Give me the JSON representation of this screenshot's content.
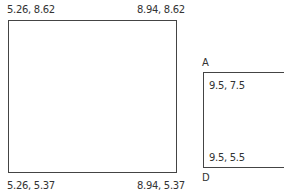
{
  "diagram": {
    "rect_left": {
      "top_left": "5.26, 8.62",
      "top_right": "8.94, 8.62",
      "bottom_left": "5.26, 5.37",
      "bottom_right": "8.94, 5.37"
    },
    "rect_right": {
      "corner_top_label": "A",
      "corner_bottom_label": "D",
      "top_left": "9.5, 7.5",
      "bottom_left": "9.5, 5.5"
    }
  }
}
